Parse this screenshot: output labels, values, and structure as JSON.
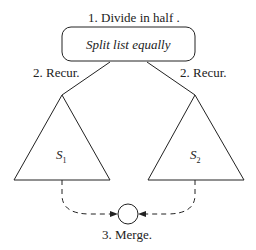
{
  "title": "1. Divide in half .",
  "box_label": "Split list equally",
  "recur_left": "2. Recur.",
  "recur_right": "2. Recur.",
  "subproblems": [
    {
      "name": "S",
      "sub": "1"
    },
    {
      "name": "S",
      "sub": "2"
    }
  ],
  "merge_label": "3. Merge."
}
